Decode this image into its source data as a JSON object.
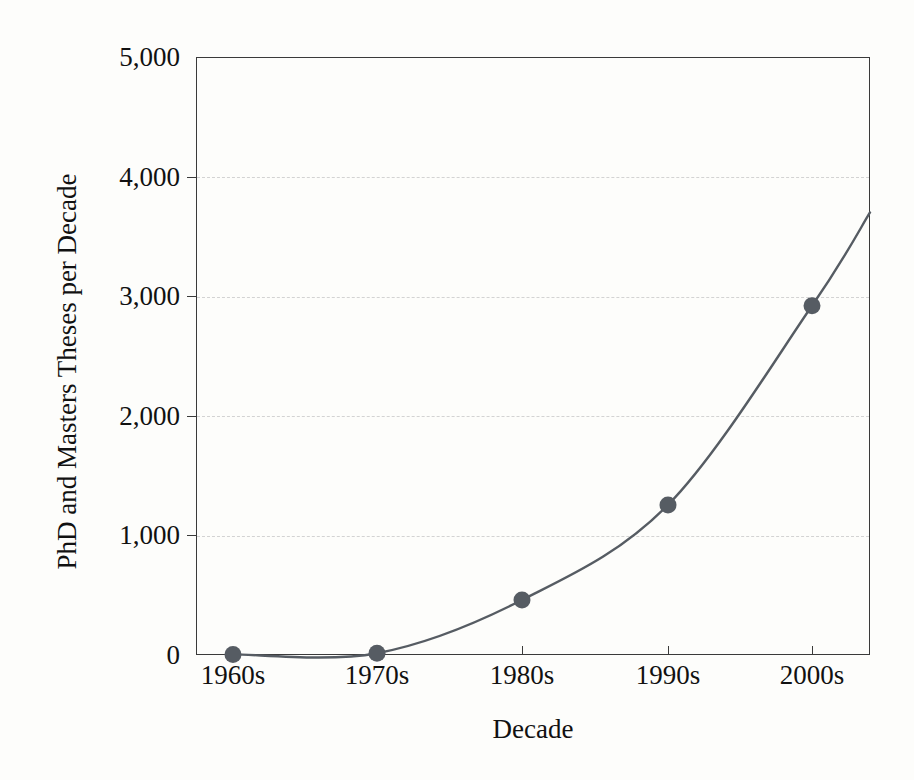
{
  "chart_data": {
    "type": "line",
    "title": "",
    "subtitle": "",
    "xlabel": "Decade",
    "ylabel": "PhD and Masters Theses per Decade",
    "categories": [
      "1960s",
      "1970s",
      "1980s",
      "1990s",
      "2000s"
    ],
    "values": [
      5,
      15,
      460,
      1255,
      2920
    ],
    "series": [
      {
        "name": "PhD and Masters Theses per Decade",
        "values": [
          5,
          15,
          460,
          1255,
          2920
        ]
      }
    ],
    "ylim": [
      0,
      5000
    ],
    "ytick_labels": [
      "0",
      "1,000",
      "2,000",
      "3,000",
      "4,000",
      "5,000"
    ],
    "ytick_values": [
      0,
      1000,
      2000,
      3000,
      4000,
      5000
    ],
    "xtick_labels": [
      "1960s",
      "1970s",
      "1980s",
      "1990s",
      "2000s"
    ],
    "grid": "horizontal-dashed",
    "legend": "none",
    "marker": "filled-circle",
    "line_extends_past_last_point": true,
    "line_end_value": 3700,
    "colors": {
      "line": "#565c63",
      "marker": "#565c63",
      "grid": "#d3d3d3",
      "axis": "#3a3a3a",
      "text": "#111111",
      "background": "#fdfdfb"
    }
  }
}
